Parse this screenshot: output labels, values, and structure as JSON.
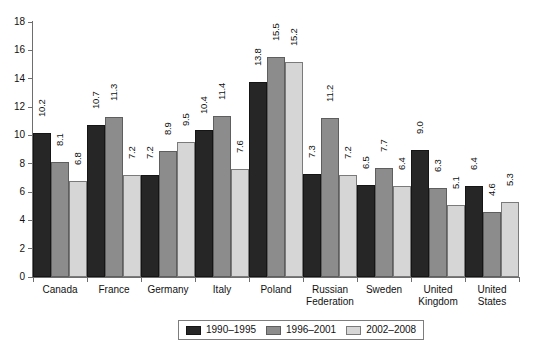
{
  "chart_data": {
    "type": "bar",
    "title": "",
    "subtitle": "",
    "xlabel": "",
    "ylabel": "",
    "ylim": [
      0,
      18
    ],
    "ytick_labels": [
      "0",
      "2",
      "4",
      "6",
      "8",
      "10",
      "12",
      "14",
      "16",
      "18"
    ],
    "ytick_values": [
      0,
      2,
      4,
      6,
      8,
      10,
      12,
      14,
      16,
      18
    ],
    "grid": false,
    "legend_position": "bottom-center",
    "categories": [
      "Canada",
      "France",
      "Germany",
      "Italy",
      "Poland",
      "Russian\nFederation",
      "Sweden",
      "United\nKingdom",
      "United\nStates"
    ],
    "series": [
      {
        "name": "1990–1995",
        "color": "#262626",
        "values": [
          10.2,
          10.7,
          7.2,
          10.4,
          13.8,
          7.3,
          6.5,
          9.0,
          6.4
        ],
        "labels": [
          "10.2",
          "10.7",
          "7.2",
          "10.4",
          "13.8",
          "7.3",
          "6.5",
          "9.0",
          "6.4"
        ]
      },
      {
        "name": "1996–2001",
        "color": "#8c8c8c",
        "values": [
          8.1,
          11.3,
          8.9,
          11.4,
          15.5,
          11.2,
          7.7,
          6.3,
          4.6
        ],
        "labels": [
          "8.1",
          "11.3",
          "8.9",
          "11.4",
          "15.5",
          "11.2",
          "7.7",
          "6.3",
          "4.6"
        ]
      },
      {
        "name": "2002–2008",
        "color": "#d6d6d6",
        "values": [
          6.8,
          7.2,
          9.5,
          7.6,
          15.2,
          7.2,
          6.4,
          5.1,
          5.3
        ],
        "labels": [
          "6.8",
          "7.2",
          "9.5",
          "7.6",
          "15.2",
          "7.2",
          "6.4",
          "5.1",
          "5.3"
        ]
      }
    ]
  },
  "legend": {
    "items": [
      {
        "label": "1990–1995"
      },
      {
        "label": "1996–2001"
      },
      {
        "label": "2002–2008"
      }
    ]
  }
}
